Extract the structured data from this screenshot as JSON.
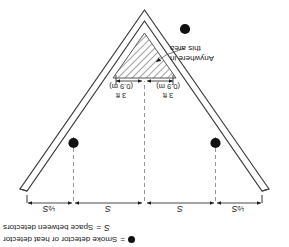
{
  "figure": {
    "orientation_note": "image scanned upside down (rotated 180 degrees)"
  },
  "legend": {
    "items": [
      {
        "icon": "filled-circle",
        "equals": "=",
        "label": "Smoke detector or heat detector"
      },
      {
        "symbol": "S",
        "equals": "=",
        "label": "Space between detectors"
      }
    ]
  },
  "dimensions": {
    "segments": [
      {
        "id": "left-half",
        "fraction": "½",
        "symbol": "S"
      },
      {
        "id": "left-full",
        "fraction": "",
        "symbol": "S"
      },
      {
        "id": "right-full",
        "fraction": "",
        "symbol": "S"
      },
      {
        "id": "right-half",
        "fraction": "½",
        "symbol": "S"
      }
    ]
  },
  "peak": {
    "left_offset": {
      "feet": "3 ft",
      "metric": "(0.9 m)"
    },
    "right_offset": {
      "feet": "3 ft",
      "metric": "(0.9 m)"
    }
  },
  "callout": {
    "line1": "Anywhere in",
    "line2": "this area"
  },
  "colors": {
    "ink": "#1a1a1a",
    "detector": "#111111",
    "hatch": "#555555",
    "dashed": "#8a8a8a",
    "ceiling_fill": "#ffffff"
  }
}
